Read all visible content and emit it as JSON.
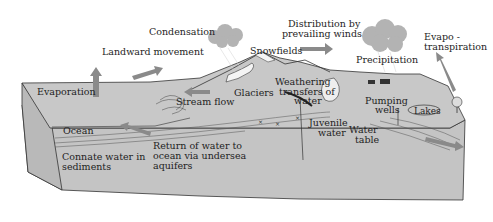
{
  "diagram": {
    "type": "hydrologic-cycle-block-diagram",
    "colors": {
      "block_fill": "#c2c2c2",
      "block_side": "#b8b8b8",
      "outline": "#333333",
      "arrow": "#8a8a8a",
      "cloud": "#b3b3b3",
      "snow": "#f4f4f4",
      "text": "#1e1e1e"
    },
    "labels": {
      "condensation": "Condensation",
      "landward_movement": "Landward movement",
      "distribution_line1": "Distribution by",
      "distribution_line2": "prevailing winds",
      "snowfields": "Snowfields",
      "precipitation": "Precipitation",
      "evapotranspiration_line1": "Evapo -",
      "evapotranspiration_line2": "transpiration",
      "evaporation": "Evaporation",
      "glaciers": "Glaciers",
      "weathering_line1": "Weathering",
      "weathering_line2": "transfers of",
      "weathering_line3": "water",
      "stream_flow": "Stream flow",
      "pumping_line1": "Pumping",
      "pumping_line2": "wells",
      "lakes": "Lakes",
      "ocean": "Ocean",
      "juvenile_line1": "Juvenile",
      "juvenile_line2": "water",
      "water_table_line1": "Water",
      "water_table_line2": "table",
      "connate_line1": "Connate water in",
      "connate_line2": "sediments",
      "return_line1": "Return of water to",
      "return_line2": "ocean via undersea",
      "return_line3": "aquifers"
    }
  }
}
